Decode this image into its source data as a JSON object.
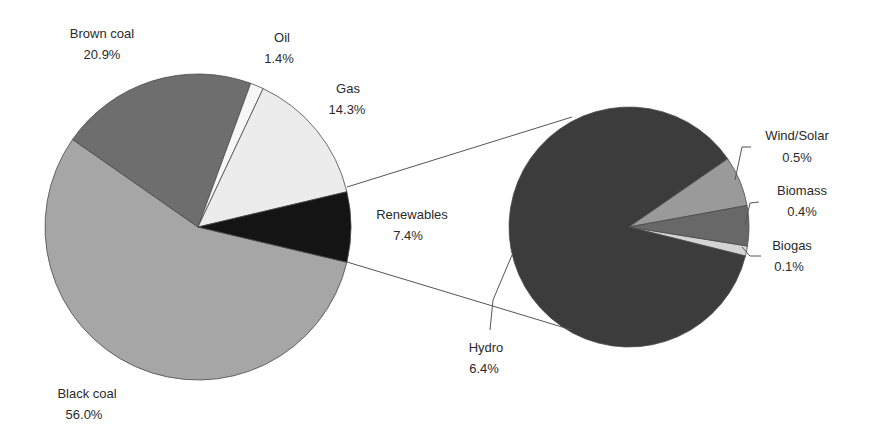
{
  "chart_data": {
    "type": "pie",
    "subtype": "pie-of-pie",
    "title": "",
    "main_pie": {
      "slices": [
        {
          "label": "Black coal",
          "value": 56.0,
          "display": "56.0%",
          "color": "#a6a6a6"
        },
        {
          "label": "Brown coal",
          "value": 20.9,
          "display": "20.9%",
          "color": "#6e6e6e"
        },
        {
          "label": "Oil",
          "value": 1.4,
          "display": "1.4%",
          "color": "#f7f7f7"
        },
        {
          "label": "Gas",
          "value": 14.3,
          "display": "14.3%",
          "color": "#ececec"
        },
        {
          "label": "Renewables",
          "value": 7.4,
          "display": "7.4%",
          "color": "#141414"
        }
      ]
    },
    "secondary_pie": {
      "expands": "Renewables",
      "slices": [
        {
          "label": "Hydro",
          "value": 6.4,
          "display": "6.4%",
          "color": "#3c3c3c"
        },
        {
          "label": "Wind/Solar",
          "value": 0.5,
          "display": "0.5%",
          "color": "#9a9a9a"
        },
        {
          "label": "Biomass",
          "value": 0.4,
          "display": "0.4%",
          "color": "#686868"
        },
        {
          "label": "Biogas",
          "value": 0.1,
          "display": "0.1%",
          "color": "#d4d4d4"
        }
      ]
    }
  },
  "labels": {
    "brown_coal": {
      "name": "Brown coal",
      "pct": "20.9%"
    },
    "oil": {
      "name": "Oil",
      "pct": "1.4%"
    },
    "gas": {
      "name": "Gas",
      "pct": "14.3%"
    },
    "renewables": {
      "name": "Renewables",
      "pct": "7.4%"
    },
    "black_coal": {
      "name": "Black coal",
      "pct": "56.0%"
    },
    "wind_solar": {
      "name": "Wind/Solar",
      "pct": "0.5%"
    },
    "biomass": {
      "name": "Biomass",
      "pct": "0.4%"
    },
    "biogas": {
      "name": "Biogas",
      "pct": "0.1%"
    },
    "hydro": {
      "name": "Hydro",
      "pct": "6.4%"
    }
  }
}
